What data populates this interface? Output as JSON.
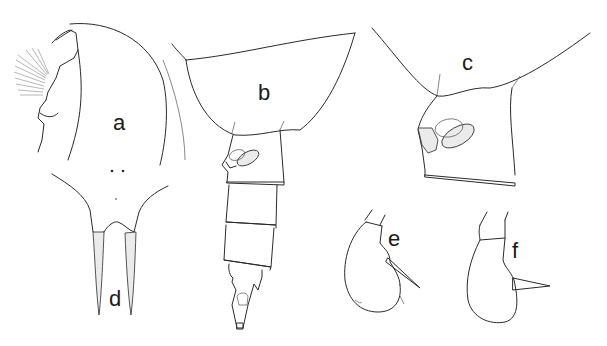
{
  "figure": {
    "type": "scientific-illustration",
    "panels": [
      {
        "id": "a",
        "label": "a",
        "part": "cephalosome (dorsal/lateral outline with setose appendage)"
      },
      {
        "id": "b",
        "label": "b",
        "part": "prosome end and urosome, lateral view"
      },
      {
        "id": "c",
        "label": "c",
        "part": "prosome end and genital segment, lateral view"
      },
      {
        "id": "d",
        "label": "d",
        "part": "caudal region with paired rami"
      },
      {
        "id": "e",
        "label": "e",
        "part": "leg segment with spine"
      },
      {
        "id": "f",
        "label": "f",
        "part": "leg segment with spine"
      }
    ],
    "colors": {
      "line": "#2a2a2a",
      "stipple": "#d9d9d9",
      "background": "#ffffff"
    }
  }
}
